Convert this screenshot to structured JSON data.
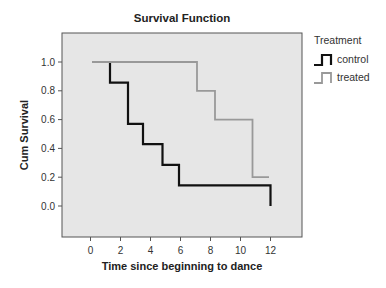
{
  "chart_data": {
    "type": "line",
    "subtype": "step",
    "title": "Survival Function",
    "xlabel": "Time since beginning to dance",
    "ylabel": "Cum Survival",
    "xlim": [
      -2,
      14
    ],
    "ylim": [
      -0.2,
      1.2
    ],
    "xticks": [
      0,
      2,
      4,
      6,
      8,
      10,
      12
    ],
    "yticks": [
      0.0,
      0.2,
      0.4,
      0.6,
      0.8,
      1.0
    ],
    "xtick_labels": [
      "0",
      "2",
      "4",
      "6",
      "8",
      "10",
      "12"
    ],
    "ytick_labels": [
      "0.0",
      "0.2",
      "0.4",
      "0.6",
      "0.8",
      "1.0"
    ],
    "grid": false,
    "background": "#e6e6e6",
    "legend": {
      "title": "Treatment",
      "position": "right-top",
      "entries": [
        "control",
        "treated"
      ]
    },
    "series": [
      {
        "name": "control",
        "color": "#111111",
        "x": [
          0.1,
          1.3,
          2.5,
          3.5,
          4.8,
          5.9,
          12.0
        ],
        "values": [
          1.0,
          0.857,
          0.571,
          0.429,
          0.286,
          0.143,
          0.0
        ]
      },
      {
        "name": "treated",
        "color": "#999999",
        "x": [
          0.1,
          7.1,
          8.3,
          10.8,
          11.9
        ],
        "values": [
          1.0,
          0.8,
          0.6,
          0.2,
          0.2
        ]
      }
    ]
  }
}
